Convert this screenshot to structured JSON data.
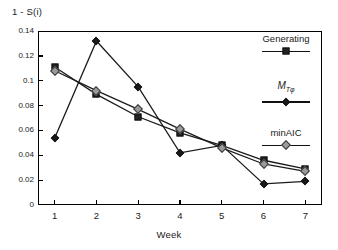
{
  "chart_data": {
    "type": "line",
    "title": "",
    "xlabel": "Week",
    "ylabel": "1 - S(i)",
    "x": [
      1,
      2,
      3,
      4,
      5,
      6,
      7
    ],
    "xtick_labels": [
      "1",
      "2",
      "3",
      "4",
      "5",
      "6",
      "7"
    ],
    "ytick_labels": [
      "0",
      "0.02",
      "0.04",
      "0.06",
      "0.08",
      "0.1",
      "0.12",
      "0.14"
    ],
    "ytick_values": [
      0,
      0.02,
      0.04,
      0.06,
      0.08,
      0.1,
      0.12,
      0.14
    ],
    "xlim": [
      0.6,
      7.4
    ],
    "ylim": [
      0,
      0.14
    ],
    "grid": false,
    "legend_position": "inside-top-right",
    "series": [
      {
        "name": "Generating",
        "marker": "filled-square",
        "color": "#222222",
        "values": [
          0.111,
          0.089,
          0.071,
          0.058,
          0.048,
          0.036,
          0.029
        ]
      },
      {
        "name": "M",
        "name_sub": "T,φ",
        "marker": "filled-diamond",
        "color": "#1a1a1a",
        "values": [
          0.054,
          0.132,
          0.095,
          0.042,
          0.048,
          0.017,
          0.019
        ]
      },
      {
        "name": "minAIC",
        "marker": "open-diamond",
        "color": "#9a9a9a",
        "values": [
          0.108,
          0.092,
          0.077,
          0.061,
          0.046,
          0.033,
          0.027
        ]
      }
    ]
  },
  "axes": {
    "y_title": "1 - S(i)",
    "x_title": "Week"
  },
  "legend": {
    "entries": [
      {
        "label": "Generating",
        "marker": "filled-square"
      },
      {
        "label": "M",
        "sub": "Tφ",
        "marker": "filled-diamond"
      },
      {
        "label": "minAIC",
        "marker": "open-diamond"
      }
    ]
  }
}
